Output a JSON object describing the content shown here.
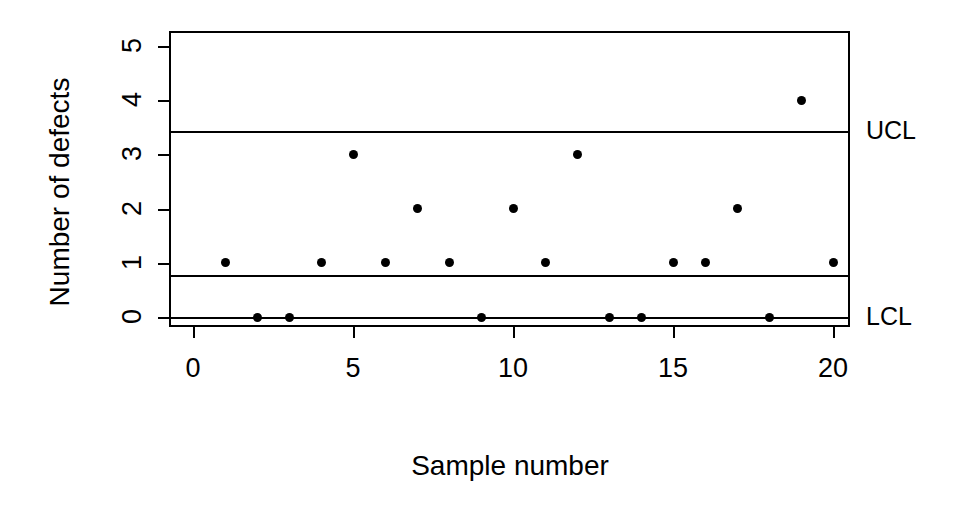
{
  "chart_data": {
    "type": "scatter",
    "title": "",
    "subtitle": "",
    "xlabel": "Sample number",
    "ylabel": "Number of defects",
    "x": [
      1,
      2,
      3,
      4,
      5,
      6,
      7,
      8,
      9,
      10,
      11,
      12,
      13,
      14,
      15,
      16,
      17,
      18,
      19,
      20
    ],
    "values": [
      1,
      0,
      0,
      1,
      3,
      1,
      2,
      1,
      0,
      2,
      1,
      3,
      0,
      0,
      1,
      1,
      2,
      0,
      4,
      1
    ],
    "series": [
      {
        "name": "Number of defects",
        "values": [
          1,
          0,
          0,
          1,
          3,
          1,
          2,
          1,
          0,
          2,
          1,
          3,
          0,
          0,
          1,
          1,
          2,
          0,
          4,
          1
        ]
      }
    ],
    "xlim": [
      -0.75,
      20.8
    ],
    "ylim": [
      -0.3,
      5.5
    ],
    "xticks": [
      0,
      5,
      10,
      15,
      20
    ],
    "yticks": [
      0,
      1,
      2,
      3,
      4,
      5
    ],
    "xtick_labels": [
      "0",
      "5",
      "10",
      "15",
      "20"
    ],
    "ytick_labels": [
      "0",
      "1",
      "2",
      "3",
      "4",
      "5"
    ],
    "grid": false,
    "legend": "none",
    "marker": "filled-circle",
    "marker_color": "#000000",
    "line_color": "#000000",
    "control_lines": [
      {
        "name": "UCL",
        "label": "UCL",
        "value": 3.44
      },
      {
        "name": "CL",
        "label": "",
        "value": 0.78
      },
      {
        "name": "LCL",
        "label": "LCL",
        "value": 0.0
      }
    ]
  },
  "annotations": {
    "ucl_label": "UCL",
    "lcl_label": "LCL"
  }
}
